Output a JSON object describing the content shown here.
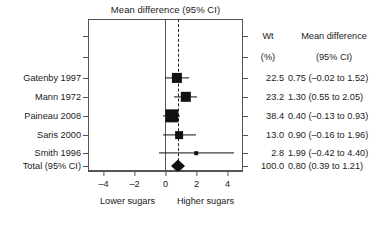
{
  "chart_data": {
    "type": "forest",
    "title": "Mean difference (95% CI)",
    "xlabel": "",
    "ylabel": "",
    "xlim": [
      -5,
      5
    ],
    "xticks": [
      -4,
      -2,
      0,
      2,
      4
    ],
    "xtick_labels": [
      "–4",
      "–2",
      "0",
      "2",
      "4"
    ],
    "grid": false,
    "reference_line": 0,
    "pooled_line": 0.8,
    "left_axis_label": "Lower sugars",
    "right_axis_label": "Higher sugars",
    "columns": {
      "study_header": "",
      "weight_header_line1": "Wt",
      "weight_header_line2": "(%)",
      "effect_header_line1": "Mean difference",
      "effect_header_line2": "(95% CI)"
    },
    "rows": [
      {
        "label": "Gatenby 1997",
        "weight": "22.5",
        "weight_value": 22.5,
        "effect": 0.75,
        "ci_low": -0.02,
        "ci_high": 1.52,
        "effect_text": "0.75 (–0.02 to 1.52)",
        "marker": "square"
      },
      {
        "label": "Mann 1972",
        "weight": "23.2",
        "weight_value": 23.2,
        "effect": 1.3,
        "ci_low": 0.55,
        "ci_high": 2.05,
        "effect_text": "1.30 (0.55 to 2.05)",
        "marker": "square"
      },
      {
        "label": "Paineau 2008",
        "weight": "38.4",
        "weight_value": 38.4,
        "effect": 0.4,
        "ci_low": -0.13,
        "ci_high": 0.93,
        "effect_text": "0.40 (–0.13 to 0.93)",
        "marker": "square"
      },
      {
        "label": "Saris 2000",
        "weight": "13.0",
        "weight_value": 13.0,
        "effect": 0.9,
        "ci_low": -0.16,
        "ci_high": 1.96,
        "effect_text": "0.90 (–0.16 to 1.96)",
        "marker": "square"
      },
      {
        "label": "Smith 1996",
        "weight": "2.8",
        "weight_value": 2.8,
        "effect": 1.99,
        "ci_low": -0.42,
        "ci_high": 4.4,
        "effect_text": "1.99 (–0.42 to 4.40)",
        "marker": "square"
      },
      {
        "label": "Total (95% CI)",
        "weight": "100.0",
        "weight_value": 100.0,
        "effect": 0.8,
        "ci_low": 0.39,
        "ci_high": 1.21,
        "effect_text": "0.80 (0.39 to 1.21)",
        "marker": "diamond"
      }
    ]
  },
  "colors": {
    "marker": "#111111",
    "frame": "#555555",
    "text": "#1a1a1a",
    "background": "#ffffff"
  }
}
